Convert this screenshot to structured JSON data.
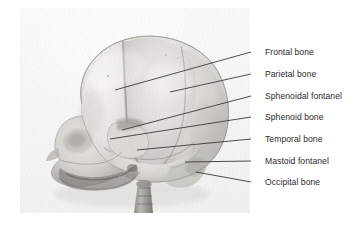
{
  "figure": {
    "background_color": "#ffffff",
    "plate_color": "#f6f6f5",
    "line_color": "#3a3a3a",
    "text_color": "#2b2b2b"
  },
  "labels": [
    {
      "id": "frontal-bone",
      "text": "Frontal bone",
      "text_x": 265,
      "text_y": 48,
      "line_x1": 251,
      "line_y1": 52,
      "line_x2": 115,
      "line_y2": 90
    },
    {
      "id": "parietal-bone",
      "text": "Parietal bone",
      "text_x": 265,
      "text_y": 70,
      "line_x1": 251,
      "line_y1": 74,
      "line_x2": 170,
      "line_y2": 92
    },
    {
      "id": "sphenoidal-fontanel",
      "text": "Sphenoidal fontanel",
      "text_x": 265,
      "text_y": 92,
      "line_x1": 251,
      "line_y1": 96,
      "line_x2": 122,
      "line_y2": 130
    },
    {
      "id": "sphenoid-bone",
      "text": "Sphenoid bone",
      "text_x": 265,
      "text_y": 113,
      "line_x1": 251,
      "line_y1": 117,
      "line_x2": 110,
      "line_y2": 139
    },
    {
      "id": "temporal-bone",
      "text": "Temporal bone",
      "text_x": 265,
      "text_y": 135,
      "line_x1": 251,
      "line_y1": 139,
      "line_x2": 137,
      "line_y2": 150
    },
    {
      "id": "mastoid-fontanel",
      "text": "Mastoid fontanel",
      "text_x": 265,
      "text_y": 157,
      "line_x1": 251,
      "line_y1": 161,
      "line_x2": 185,
      "line_y2": 162
    },
    {
      "id": "occipital-bone",
      "text": "Occipital bone",
      "text_x": 265,
      "text_y": 178,
      "line_x1": 251,
      "line_y1": 182,
      "line_x2": 196,
      "line_y2": 172
    }
  ]
}
